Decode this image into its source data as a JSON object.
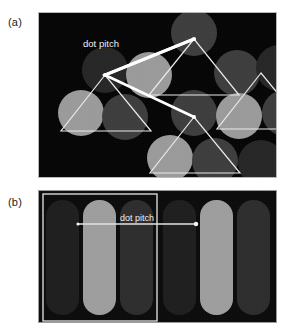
{
  "figure": {
    "kind": "scientific-figure-grayscale",
    "background_color": "#ffffff",
    "width": 286,
    "height": 333
  },
  "panels": [
    {
      "id": "a",
      "label": "(a)",
      "caption_label": "dot pitch",
      "description": "Triad dot mask: round phosphor dots in a hexagonal arrangement with overlaid triangles and a dot-pitch arrow between two adjacent same-color dot centers.",
      "frame": {
        "x": 38,
        "y": 12,
        "width": 239,
        "height": 166
      },
      "background_color": "#050505",
      "border_color": "#b9b9b9",
      "colors": {
        "dot_light": "#9a9a9a",
        "dot_mid": "#3d3d3d",
        "dot_dark": "#262626",
        "line": "#f5f5f5",
        "thick_line": "#ffffff"
      },
      "dot_radius": 23,
      "dots": [
        {
          "cx": 155,
          "cy": 20,
          "tone": "dot_mid"
        },
        {
          "cx": 66,
          "cy": 57,
          "tone": "dot_dark"
        },
        {
          "cx": 110,
          "cy": 62,
          "tone": "dot_light"
        },
        {
          "cx": 198,
          "cy": 60,
          "tone": "dot_mid"
        },
        {
          "cx": 240,
          "cy": 55,
          "tone": "dot_dark"
        },
        {
          "cx": 42,
          "cy": 100,
          "tone": "dot_light"
        },
        {
          "cx": 86,
          "cy": 104,
          "tone": "dot_mid"
        },
        {
          "cx": 155,
          "cy": 100,
          "tone": "dot_mid"
        },
        {
          "cx": 200,
          "cy": 103,
          "tone": "dot_light"
        },
        {
          "cx": 246,
          "cy": 100,
          "tone": "dot_mid"
        },
        {
          "cx": 131,
          "cy": 145,
          "tone": "dot_light"
        },
        {
          "cx": 176,
          "cy": 148,
          "tone": "dot_mid"
        },
        {
          "cx": 222,
          "cy": 150,
          "tone": "dot_dark"
        }
      ],
      "triangles": [
        {
          "name": "triangle-center",
          "points": "155,26 110,82 200,82"
        },
        {
          "name": "triangle-left",
          "points": "66,62 22,118 112,118"
        },
        {
          "name": "triangle-right",
          "points": "222,60 178,116 268,116"
        },
        {
          "name": "triangle-bottom",
          "points": "155,104 111,160 201,160"
        }
      ],
      "arrow": {
        "name": "dot-pitch-arrow",
        "from": {
          "x": 66,
          "y": 62
        },
        "to": {
          "x": 155,
          "y": 26
        },
        "tail": {
          "x": 155,
          "y": 104
        },
        "label": "dot pitch",
        "label_pos": {
          "x": 62,
          "y": 34
        }
      }
    },
    {
      "id": "b",
      "label": "(b)",
      "caption_label": "dot pitch",
      "description": "Aperture-grille stripe mask: vertical rounded phosphor stripes in repeating RGB triads, with one triad outlined and a dot-pitch arrow spanning one full triad.",
      "frame": {
        "x": 38,
        "y": 190,
        "width": 239,
        "height": 133
      },
      "background_color": "#0b0b0b",
      "border_color": "#9a9a9a",
      "colors": {
        "stripe_dark": "#1e1e1e",
        "stripe_light": "#9d9d9d",
        "stripe_mid": "#2d2d2d",
        "outline": "#e8e8e8",
        "line": "#e3e3e3"
      },
      "stripe_geometry": {
        "width": 33,
        "top": 9,
        "height": 115,
        "radius": 16
      },
      "stripes": [
        {
          "x": 7,
          "tone": "stripe_dark"
        },
        {
          "x": 44,
          "tone": "stripe_light"
        },
        {
          "x": 81,
          "tone": "stripe_mid"
        },
        {
          "x": 124,
          "tone": "stripe_dark"
        },
        {
          "x": 161,
          "tone": "stripe_light"
        },
        {
          "x": 198,
          "tone": "stripe_mid"
        }
      ],
      "triad_outline": {
        "x": 4,
        "y": 3,
        "width": 114,
        "height": 127
      },
      "arrow": {
        "name": "dot-pitch-arrow",
        "from": {
          "x": 39,
          "y": 33
        },
        "to": {
          "x": 157,
          "y": 33
        },
        "label": "dot pitch",
        "label_pos": {
          "x": 98,
          "y": 30
        }
      }
    }
  ]
}
